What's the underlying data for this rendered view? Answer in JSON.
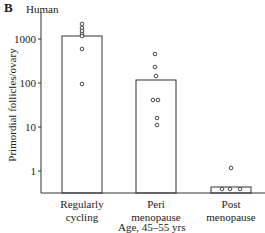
{
  "panel": {
    "letter": "B",
    "subtitle": "Human"
  },
  "colors": {
    "stroke": "#333333",
    "background": "#ffffff"
  },
  "chart_data": {
    "type": "bar",
    "title": "Human",
    "panel_label": "B",
    "xlabel": "Age, 45–55 yrs",
    "ylabel": "Primordial follicles/ovary",
    "yscale": "log",
    "ylim": [
      0.3,
      4000
    ],
    "yticks": [
      1,
      10,
      100,
      1000
    ],
    "ytick_labels": [
      "1",
      "10",
      "100",
      "1000"
    ],
    "grid": false,
    "legend": null,
    "categories": [
      "Regularly cycling",
      "Peri menopause",
      "Post menopause"
    ],
    "category_lines": [
      [
        "Regularly",
        "cycling"
      ],
      [
        "Peri",
        "menopause"
      ],
      [
        "Post",
        "menopause"
      ]
    ],
    "values": [
      1200,
      120,
      0.5
    ],
    "points": [
      [
        2000,
        1600,
        1400,
        1200,
        1100,
        600,
        100
      ],
      [
        450,
        230,
        150,
        40,
        40,
        15,
        10
      ],
      [
        1.2,
        0.4,
        0.4,
        0.4
      ]
    ]
  },
  "layout": {
    "axis": {
      "x": 41,
      "top": 12,
      "baseline": 193,
      "right": 265
    },
    "tick_y": {
      "1": 171,
      "10": 127,
      "100": 83,
      "1000": 39
    },
    "bars": [
      {
        "x0": 62,
        "x1": 102,
        "top": 36
      },
      {
        "x0": 136,
        "x1": 176,
        "top": 80
      },
      {
        "x0": 211,
        "x1": 251,
        "top": 187
      }
    ],
    "dots": [
      [
        [
          82,
          24
        ],
        [
          82,
          28
        ],
        [
          82,
          31
        ],
        [
          82,
          34
        ],
        [
          82,
          36
        ],
        [
          82,
          49
        ],
        [
          82,
          84
        ]
      ],
      [
        [
          155,
          54
        ],
        [
          155,
          67
        ],
        [
          156,
          76
        ],
        [
          153,
          100
        ],
        [
          158,
          100
        ],
        [
          157,
          118
        ],
        [
          157,
          125
        ]
      ],
      [
        [
          231,
          168
        ],
        [
          222,
          189
        ],
        [
          230,
          189
        ],
        [
          240,
          189
        ]
      ]
    ]
  }
}
